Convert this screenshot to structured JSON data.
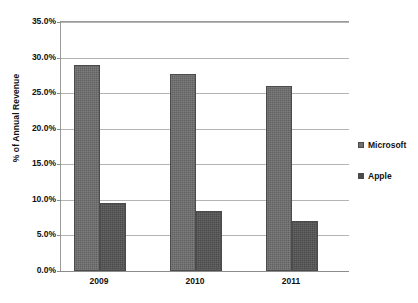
{
  "chart_data": {
    "type": "bar",
    "title": "",
    "xlabel": "",
    "ylabel": "% of Annual Revenue",
    "categories": [
      "2009",
      "2010",
      "2011"
    ],
    "series": [
      {
        "name": "Microsoft",
        "color": "#6e6e6e",
        "values": [
          28.9,
          27.7,
          26.0
        ]
      },
      {
        "name": "Apple",
        "color": "#4a4a4a",
        "values": [
          9.6,
          8.5,
          7.0
        ]
      }
    ],
    "ylim": [
      0,
      35
    ],
    "ytick_step": 5,
    "ytick_labels": [
      "0.0%",
      "5.0%",
      "10.0%",
      "15.0%",
      "20.0%",
      "25.0%",
      "30.0%",
      "35.0%"
    ],
    "ytick_values": [
      0,
      5,
      10,
      15,
      20,
      25,
      30,
      35
    ],
    "grid": true,
    "legend_position": "right"
  }
}
